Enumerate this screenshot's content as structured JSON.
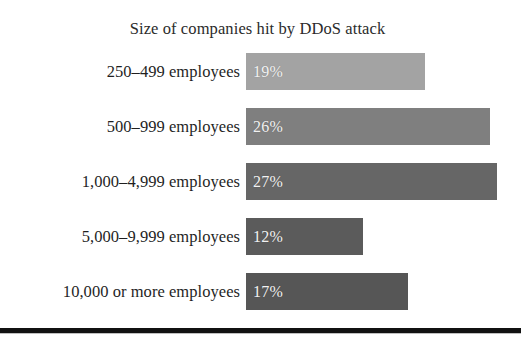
{
  "chart_data": {
    "type": "bar",
    "orientation": "horizontal",
    "title": "Size of companies hit by DDoS attack",
    "xlabel": "",
    "ylabel": "",
    "grid": false,
    "legend": "none",
    "xlim": [
      0,
      29
    ],
    "categories": [
      "250–499 employees",
      "500–999 employees",
      "1,000–4,999 employees",
      "5,000–9,999 employees",
      "10,000 or more employees"
    ],
    "values": [
      19,
      26,
      27,
      12,
      17
    ],
    "value_labels": [
      "19%",
      "26%",
      "27%",
      "12%",
      "17%"
    ],
    "bar_colors": [
      "#a3a3a3",
      "#7f7f7f",
      "#666666",
      "#5b5b5b",
      "#565656"
    ],
    "bars": [
      {
        "category": "250–499 employees",
        "value": 19,
        "label": "19%",
        "color": "#a3a3a3",
        "width_px": 179
      },
      {
        "category": "500–999 employees",
        "value": 26,
        "label": "26%",
        "color": "#7f7f7f",
        "width_px": 244
      },
      {
        "category": "1,000–4,999 employees",
        "value": 27,
        "label": "27%",
        "color": "#666666",
        "width_px": 251
      },
      {
        "category": "5,000–9,999 employees",
        "value": 12,
        "label": "12%",
        "color": "#5b5b5b",
        "width_px": 117
      },
      {
        "category": "10,000 or more employees",
        "value": 17,
        "label": "17%",
        "color": "#565656",
        "width_px": 162
      }
    ]
  },
  "figure": {
    "background": "#ffffff",
    "rule_color": "#111111"
  }
}
